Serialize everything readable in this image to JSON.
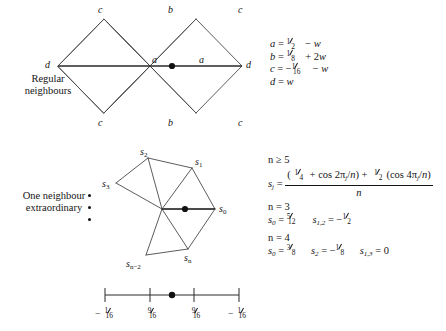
{
  "figure": {
    "title_top": "Regular neighbours",
    "title_mid": "One neighbour extraordinary"
  },
  "panel_regular": {
    "caption_line1": "Regular",
    "caption_line2": "neighbours",
    "vertex_labels": {
      "top_left": "c",
      "top_mid": "b",
      "top_right": "c",
      "bottom_left": "c",
      "bottom_mid": "b",
      "bottom_right": "c",
      "left_end": "d",
      "right_end": "d",
      "inner_left": "a",
      "inner_right": "a"
    },
    "equations": [
      {
        "lhs": "a",
        "rel": "=",
        "rhs_num": "1",
        "rhs_den": "2",
        "sign": "",
        "tail": "− w"
      },
      {
        "lhs": "b",
        "rel": "=",
        "rhs_num": "1",
        "rhs_den": "8",
        "sign": "",
        "tail": "+ 2w"
      },
      {
        "lhs": "c",
        "rel": "=",
        "rhs_num": "1",
        "rhs_den": "16",
        "sign": "−",
        "tail": "− w"
      },
      {
        "lhs": "d",
        "rel": "=",
        "rhs_num": "",
        "rhs_den": "",
        "sign": "",
        "tail": "w"
      }
    ],
    "equations_plain": [
      "a = 1/2 − w",
      "b = 1/8 + 2w",
      "c = −1/16 − w",
      "d = w"
    ]
  },
  "panel_extraordinary": {
    "caption_line1": "One neighbour",
    "caption_line2": "extraordinary",
    "vertex_labels": {
      "s0": "s",
      "s0_sub": "0",
      "s1": "s",
      "s1_sub": "1",
      "s2": "s",
      "s2_sub": "2",
      "s3": "s",
      "s3_sub": "3",
      "sn": "s",
      "sn_sub": "n",
      "sn2": "s",
      "sn2_sub": "n−2"
    },
    "ellipsis_dots": 3,
    "formula": {
      "condition": "n ≥ 5",
      "lhs": "s",
      "lhs_sub": "j",
      "rel": "=",
      "numerator_parts": [
        {
          "frac_num": "1",
          "frac_den": "4",
          "text": " + cos 2π"
        },
        {
          "sub": "j",
          "text": "/n) + "
        },
        {
          "frac_num": "1",
          "frac_den": "2",
          "text": "(cos 4π"
        },
        {
          "sub": "j",
          "text": "/n)"
        }
      ],
      "numerator_plain": "(1/4 + cos 2πj/n) + 1/2(cos 4πj/n)",
      "denominator": "n"
    },
    "cases": [
      {
        "n_label": "n = 3",
        "values": [
          {
            "sym": "s",
            "sub": "0",
            "rel": "=",
            "num": "5",
            "den": "12",
            "sign": ""
          },
          {
            "sym": "s",
            "sub": "1,2",
            "rel": "=",
            "num": "1",
            "den": "2",
            "sign": "−"
          }
        ],
        "values_plain": "s₀ = 5/12   s₁,₂ = −1/2"
      },
      {
        "n_label": "n = 4",
        "values": [
          {
            "sym": "s",
            "sub": "0",
            "rel": "=",
            "num": "3",
            "den": "8",
            "sign": ""
          },
          {
            "sym": "s",
            "sub": "2",
            "rel": "=",
            "num": "1",
            "den": "8",
            "sign": "−"
          },
          {
            "sym": "s",
            "sub": "1,3",
            "rel": "=",
            "num": "",
            "den": "",
            "sign": "",
            "plain": "0"
          }
        ],
        "values_plain": "s₀ = 3/8   s₂ = −1/8   s₁,₃ = 0"
      }
    ]
  },
  "scale_bar": {
    "ticks": [
      {
        "num": "1",
        "den": "16",
        "sign": "−",
        "plain": "−1/16"
      },
      {
        "num": "9",
        "den": "16",
        "sign": "",
        "plain": "9/16"
      },
      {
        "num": "9",
        "den": "16",
        "sign": "",
        "plain": "9/16"
      },
      {
        "num": "1",
        "den": "16",
        "sign": "−",
        "plain": "−1/16"
      }
    ],
    "center_marker": "filled-dot"
  },
  "colors": {
    "ink": "#141414",
    "line": "#4a4a4a",
    "heavy_line": "#2a2a2a",
    "background": "#ffffff"
  }
}
